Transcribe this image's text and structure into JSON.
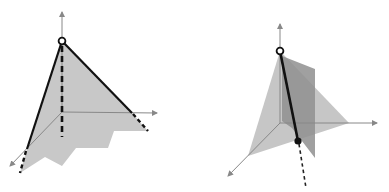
{
  "figures": [
    {
      "id": "left",
      "description": "3D axes with gray triangular surface, apex open circle, dashed vertical drop line, staircase-shaped shaded region",
      "colors": {
        "surface": "#c8c8c8",
        "edge": "#111111",
        "axis": "#888888"
      },
      "axes": {
        "origin": [
          62,
          112
        ],
        "z_top": [
          62,
          12
        ],
        "x_end": [
          157,
          113
        ],
        "y_end": [
          10,
          166
        ]
      },
      "apex": [
        62,
        41
      ],
      "corners": {
        "right": [
          132,
          113
        ],
        "left": [
          27,
          149
        ]
      },
      "dashed_extensions": [
        {
          "from": [
            132,
            113
          ],
          "to": [
            148,
            131
          ]
        },
        {
          "from": [
            27,
            149
          ],
          "to": [
            20,
            173
          ]
        },
        {
          "from": [
            62,
            44
          ],
          "to": [
            62,
            137
          ]
        }
      ],
      "staircase_points": [
        [
          62,
          41
        ],
        [
          132,
          113
        ],
        [
          148,
          131
        ],
        [
          114,
          131
        ],
        [
          108,
          148
        ],
        [
          76,
          148
        ],
        [
          62,
          166
        ],
        [
          45,
          157
        ],
        [
          20,
          173
        ],
        [
          27,
          149
        ]
      ]
    },
    {
      "id": "right",
      "description": "3D axes with light gray tilted plane and darker vertical plane, black segment from open circle apex to filled dot with dashed continuation",
      "colors": {
        "light_plane": "#c6c6c6",
        "dark_plane": "#8f8f8f",
        "edge": "#111111",
        "axis": "#888888"
      },
      "axes": {
        "origin": [
          86,
          123
        ],
        "z_top": [
          86,
          24
        ],
        "x_end": [
          183,
          123
        ],
        "y_end": [
          34,
          176
        ]
      },
      "apex_open": [
        86,
        51
      ],
      "point_filled": [
        104,
        141
      ],
      "dashed_to": [
        112,
        188
      ],
      "light_plane": [
        [
          86,
          51
        ],
        [
          155,
          123
        ],
        [
          54,
          156
        ]
      ],
      "dark_plane": [
        [
          88,
          56
        ],
        [
          121,
          69
        ],
        [
          121,
          158
        ],
        [
          98,
          128
        ],
        [
          88,
          121
        ]
      ]
    }
  ]
}
